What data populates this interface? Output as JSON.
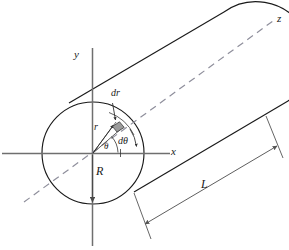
{
  "figure": {
    "colors": {
      "outline": "#1a1a1a",
      "axis": "#6b6b6b",
      "dashed_axis": "#8c8c99",
      "dimension": "#555555",
      "element_fill": "#9b9b9b",
      "background": "#ffffff",
      "text": "#1a1a1a"
    },
    "labels": {
      "y_axis": "y",
      "x_axis": "x",
      "z_axis": "z",
      "radius": "R",
      "length": "L",
      "radial_coordinate": "r",
      "radial_thickness": "dr",
      "angular_increment": "dθ",
      "angle": "θ"
    },
    "geometry": {
      "circle_center_x": 93,
      "circle_center_y": 153,
      "circle_radius": 51,
      "element_radius": 34,
      "element_angle_deg": 53,
      "axis_x_start": 2,
      "axis_x_end": 173,
      "axis_y_top": 48,
      "axis_y_bottom": 246
    }
  }
}
